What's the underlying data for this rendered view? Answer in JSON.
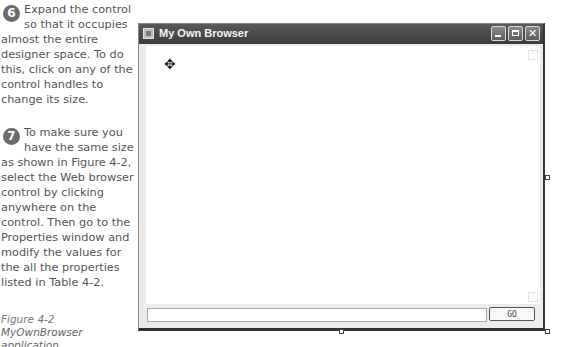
{
  "instructions": {
    "steps": [
      {
        "number": "6",
        "text": "Expand the control so that it occupies almost the entire designer space. To do this, click on any of the control handles to change its size."
      },
      {
        "number": "7",
        "text": "To make sure you have the same size as shown in Figure 4-2, select the Web browser control by clicking anywhere on the control. Then go to the Properties window and modify the values for the all the properties listed in Table 4-2."
      }
    ],
    "caption": {
      "figure": "Figure 4-2",
      "title": "MyOwnBrowser application"
    }
  },
  "window": {
    "title": "My Own Browser",
    "controls": {
      "minimize": "minimize",
      "maximize": "maximize",
      "close": "close"
    },
    "address_input": {
      "value": "",
      "placeholder": ""
    },
    "go_button_label": "GO",
    "icons": {
      "move": "✥",
      "scroll_up": "˄",
      "scroll_down": "˅"
    }
  },
  "colors": {
    "titlebar": "#444444",
    "step_badge": "#6b6b6b",
    "form_background": "#ececec"
  }
}
